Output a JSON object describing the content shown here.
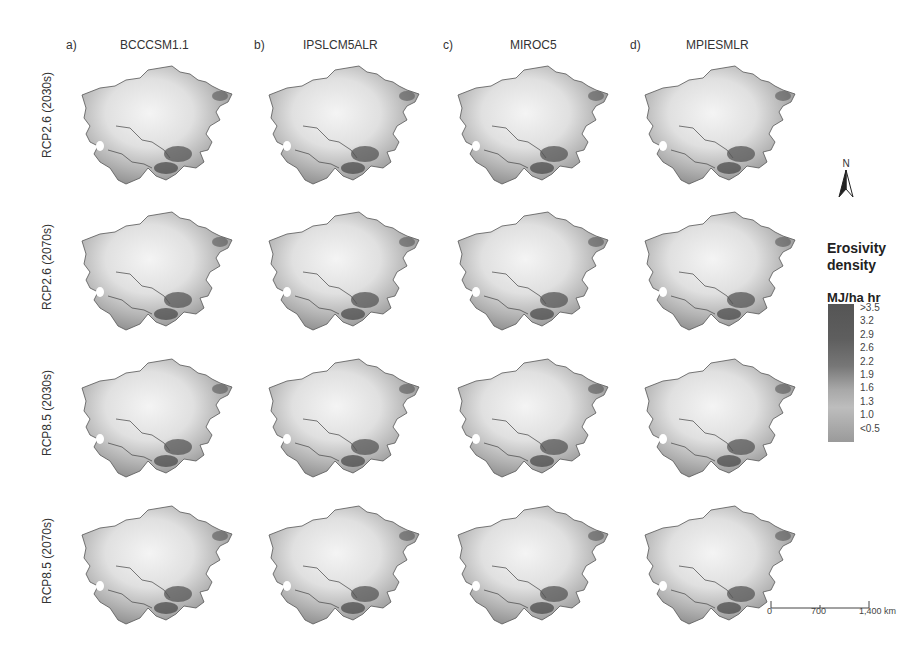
{
  "figure": {
    "columns": [
      {
        "letter": "a)",
        "model": "BCCCSM1.1"
      },
      {
        "letter": "b)",
        "model": "IPSLCM5ALR"
      },
      {
        "letter": "c)",
        "model": "MIROC5"
      },
      {
        "letter": "d)",
        "model": "MPIESMLR"
      }
    ],
    "rows": [
      {
        "label": "RCP2.6 (2030s)"
      },
      {
        "label": "RCP2.6 (2070s)"
      },
      {
        "label": "RCP8.5 (2030s)"
      },
      {
        "label": "RCP8.5 (2070s)"
      }
    ]
  },
  "legend": {
    "title_line1": "Erosivity",
    "title_line2": "density",
    "unit": "MJ/ha hr",
    "ticks": [
      ">3.5",
      "3.2",
      "2.9",
      "2.6",
      "2.2",
      "1.9",
      "1.6",
      "1.3",
      "1.0",
      "<0.5"
    ]
  },
  "north_arrow": {
    "label": "N"
  },
  "scale_bar": {
    "labels": [
      "0",
      "700",
      "1,400 km"
    ]
  }
}
